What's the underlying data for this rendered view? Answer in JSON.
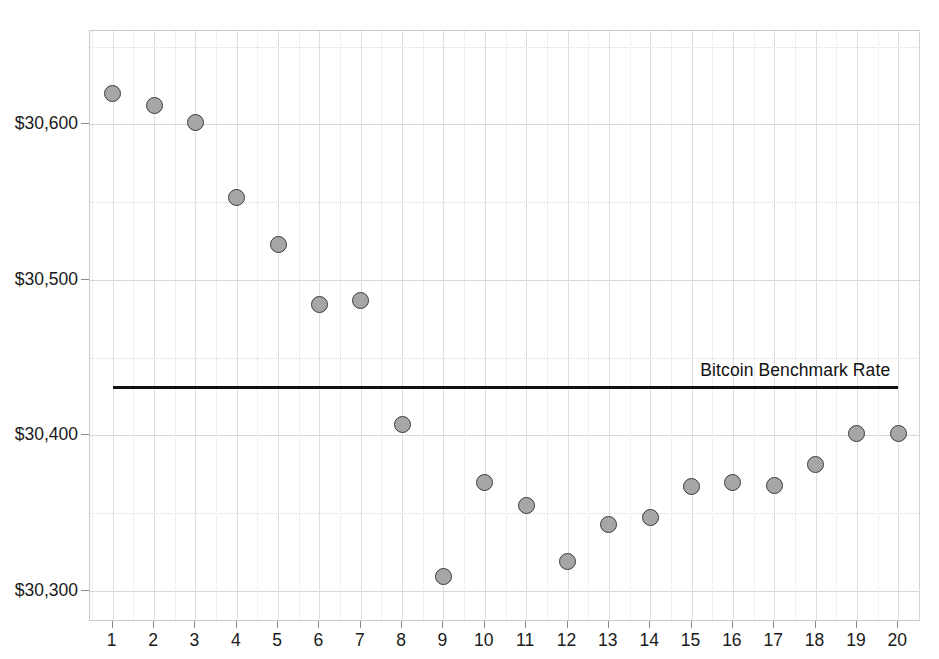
{
  "chart_data": {
    "type": "scatter",
    "title": "",
    "xlabel": "",
    "ylabel": "",
    "x": [
      1,
      2,
      3,
      4,
      5,
      6,
      7,
      8,
      9,
      10,
      11,
      12,
      13,
      14,
      15,
      16,
      17,
      18,
      19,
      20
    ],
    "categories": [
      "1",
      "2",
      "3",
      "4",
      "5",
      "6",
      "7",
      "8",
      "9",
      "10",
      "11",
      "12",
      "13",
      "14",
      "15",
      "16",
      "17",
      "18",
      "19",
      "20"
    ],
    "series": [
      {
        "name": "Bitcoin Price",
        "marker": "circle",
        "marker_fill": "#a6a6a6",
        "marker_edge": "#3a3a3a",
        "values": [
          30620,
          30612,
          30601,
          30553,
          30523,
          30484,
          30487,
          30407,
          30309,
          30370,
          30355,
          30319,
          30343,
          30347,
          30367,
          30370,
          30368,
          30381,
          30401,
          30401
        ]
      }
    ],
    "reference_lines": [
      {
        "label": "Bitcoin Benchmark Rate",
        "value": 30432,
        "color": "#111111",
        "x_start": 1,
        "x_end": 20
      }
    ],
    "ylim": [
      30280,
      30660
    ],
    "xlim": [
      0.45,
      20.55
    ],
    "ytick_values": [
      30300,
      30400,
      30500,
      30600
    ],
    "ytick_labels": [
      "$30,300",
      "$30,400",
      "$30,500",
      "$30,600"
    ],
    "y_minor_tick_values": [
      30350,
      30450,
      30550,
      30650
    ],
    "grid": true,
    "grid_color": "#d8d8d8",
    "legend": "none",
    "background": "#ffffff",
    "plot_border_color": "#c9c9c9"
  }
}
